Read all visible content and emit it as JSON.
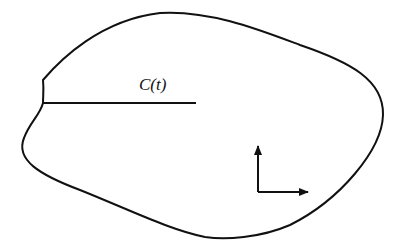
{
  "diagram": {
    "type": "region-with-crack",
    "label": "C(t)",
    "colors": {
      "stroke": "#111111",
      "background": "#ffffff"
    },
    "elements": [
      {
        "name": "closed-boundary",
        "kind": "closed-curve"
      },
      {
        "name": "crack-line",
        "kind": "line",
        "from": [
          43,
          103
        ],
        "to": [
          196,
          103
        ]
      },
      {
        "name": "crack-label",
        "kind": "text",
        "text": "C(t)"
      },
      {
        "name": "coordinate-axes",
        "kind": "axes",
        "origin": [
          258,
          192
        ],
        "directions": [
          "up",
          "right"
        ]
      }
    ]
  }
}
